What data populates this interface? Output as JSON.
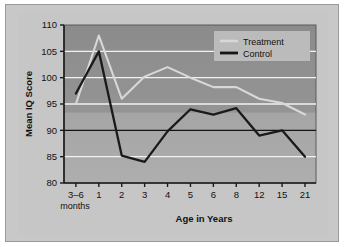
{
  "figure": {
    "background_color": "#c8c8c8",
    "border_color": "#9a9a9a"
  },
  "chart_data": {
    "type": "line",
    "title": "",
    "xlabel": "Age in Years",
    "ylabel": "Mean IQ Score",
    "categories": [
      "3–6\nmonths",
      "1",
      "2",
      "3",
      "4",
      "5",
      "6",
      "8",
      "12",
      "15",
      "21"
    ],
    "tick_labels_x": [
      "3–6",
      "1",
      "2",
      "3",
      "4",
      "5",
      "6",
      "8",
      "12",
      "15",
      "21"
    ],
    "tick_sublabel_x": "months",
    "tick_labels_y": [
      "80",
      "85",
      "90",
      "95",
      "100",
      "105",
      "110"
    ],
    "ylim": [
      80,
      110
    ],
    "ytick_step": 5,
    "grid": true,
    "grid_color": "#f2f2f2",
    "baseline_value": 90,
    "baseline_color": "#111111",
    "plot_background_top": "#8f8f8f",
    "plot_background_bottom": "#a8a8a8",
    "legend_position": "top-right",
    "series": [
      {
        "name": "Treatment",
        "color": "#d8d8d8",
        "values": [
          95.0,
          108.0,
          96.0,
          100.2,
          102.0,
          100.0,
          98.2,
          98.2,
          96.0,
          95.2,
          93.0
        ]
      },
      {
        "name": "Control",
        "color": "#1a1a1a",
        "values": [
          97.0,
          105.0,
          85.2,
          84.0,
          89.8,
          94.0,
          93.0,
          94.2,
          89.0,
          90.0,
          85.0
        ]
      }
    ]
  },
  "legend": {
    "background_color": "#bdbdbd",
    "entries": [
      {
        "label": "Treatment",
        "color": "#d8d8d8"
      },
      {
        "label": "Control",
        "color": "#1a1a1a"
      }
    ]
  }
}
